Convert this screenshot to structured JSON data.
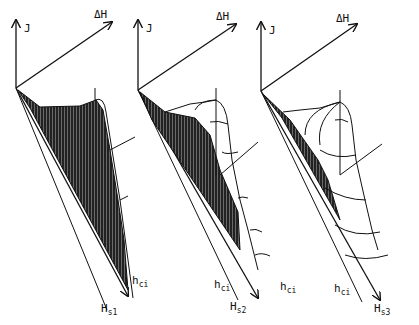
{
  "figure": {
    "panels": [
      {
        "id": "panel-1",
        "axes": {
          "y": "J",
          "depth": "ΔH",
          "x1": "h",
          "x1_sub": "ci",
          "x2": "H",
          "x2_sub": "s1"
        }
      },
      {
        "id": "panel-2",
        "axes": {
          "y": "J",
          "depth": "ΔH",
          "x1": "h",
          "x1_sub": "ci",
          "x2": "H",
          "x2_sub": "s2"
        }
      },
      {
        "id": "panel-3",
        "axes": {
          "y": "J",
          "depth": "ΔH",
          "x1": "h",
          "x1_sub": "ci",
          "x2": "H",
          "x2_sub": "s3"
        }
      }
    ],
    "colors": {
      "ink": "#111111",
      "background": "#ffffff"
    }
  }
}
